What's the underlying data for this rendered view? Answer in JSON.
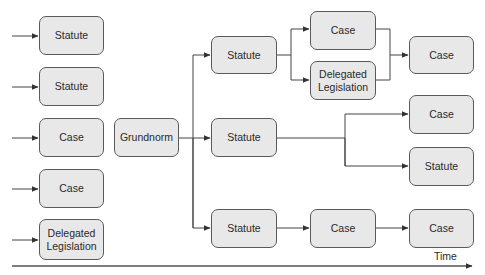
{
  "diagram": {
    "title": "",
    "colors": {
      "node_fill": "#e8e8e8",
      "node_border": "#5a5a5a",
      "line": "#444444",
      "text": "#2a2a2a"
    },
    "nodes": {
      "left_1": "Statute",
      "left_2": "Statute",
      "left_3": "Case",
      "left_4": "Case",
      "left_5": "Delegated\nLegislation",
      "grundnorm": "Grundnorm",
      "mid_top": "Statute",
      "mid_middle": "Statute",
      "mid_bottom": "Statute",
      "col3_top_case": "Case",
      "col3_delegated": "Delegated\nLegislation",
      "col3_bottom_case": "Case",
      "right_top_case": "Case",
      "right_mid_case": "Case",
      "right_statute": "Statute",
      "right_bottom_case": "Case"
    },
    "edges": [
      [
        "external",
        "left_1"
      ],
      [
        "external",
        "left_2"
      ],
      [
        "external",
        "left_3"
      ],
      [
        "external",
        "left_4"
      ],
      [
        "external",
        "left_5"
      ],
      [
        "grundnorm",
        "mid_top"
      ],
      [
        "grundnorm",
        "mid_middle"
      ],
      [
        "grundnorm",
        "mid_bottom"
      ],
      [
        "mid_top",
        "col3_top_case"
      ],
      [
        "mid_top",
        "col3_delegated"
      ],
      [
        "col3_top_case",
        "right_top_case"
      ],
      [
        "col3_delegated",
        "right_top_case"
      ],
      [
        "mid_middle",
        "right_mid_case"
      ],
      [
        "mid_middle",
        "right_statute"
      ],
      [
        "mid_bottom",
        "col3_bottom_case"
      ],
      [
        "col3_bottom_case",
        "right_bottom_case"
      ]
    ],
    "axis": {
      "label": "Time",
      "direction": "left-to-right"
    }
  }
}
